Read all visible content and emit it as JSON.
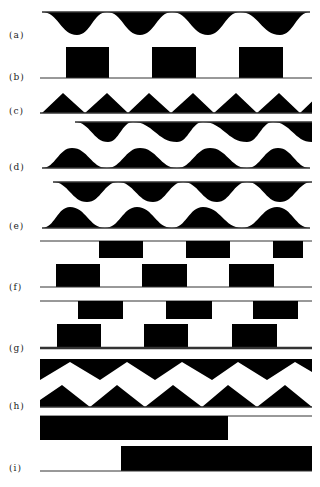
{
  "figure": {
    "fill_color": "#000000",
    "line_color": "#333333",
    "background": "#ffffff",
    "x_start": 40,
    "x_end": 312
  },
  "panels": [
    {
      "id": "a",
      "label": "(a)",
      "label_y": 35,
      "shape": "smooth-wave-hanging",
      "top_line_y": 12,
      "trough_y": 35,
      "x_start": 42,
      "x_end": 310,
      "troughs_x": [
        77,
        140,
        208,
        280
      ],
      "peaks_x": [
        42,
        107,
        172,
        240,
        310
      ]
    },
    {
      "id": "b",
      "label": "(b)",
      "label_y": 77,
      "shape": "rect-pulses",
      "baseline_y": 78,
      "top_y": 47,
      "pulses": [
        [
          66,
          109
        ],
        [
          152,
          196
        ],
        [
          239,
          283
        ]
      ]
    },
    {
      "id": "c",
      "label": "(c)",
      "label_y": 111,
      "shape": "triangle-wave",
      "baseline_y": 113,
      "peak_y": 93,
      "valleys_x": [
        42,
        85,
        128,
        171,
        214,
        257,
        300
      ],
      "peaks_x": [
        63,
        107,
        149,
        193,
        236,
        279
      ],
      "x_end": 312
    },
    {
      "id": "d",
      "label": "(d)",
      "label_y": 167,
      "shape": "double-smooth-wave",
      "upper": {
        "top_line_y": 122,
        "trough_y": 142,
        "x_start": 75,
        "x_end": 312,
        "peaks_x": [
          75,
          133,
          203,
          273
        ],
        "troughs_x": [
          108,
          177,
          247,
          312
        ]
      },
      "lower": {
        "baseline_y": 168,
        "peak_y": 148,
        "x_start": 42,
        "x_end": 310,
        "valleys_x": [
          42,
          107,
          177,
          247,
          310
        ],
        "peaks_x": [
          72,
          140,
          210,
          278
        ]
      }
    },
    {
      "id": "e",
      "label": "(e)",
      "label_y": 226,
      "shape": "double-smooth-wave",
      "upper": {
        "top_line_y": 182,
        "trough_y": 202,
        "x_start": 53,
        "x_end": 312,
        "peaks_x": [
          53,
          118,
          183,
          247,
          312
        ],
        "troughs_x": [
          87,
          153,
          217,
          280
        ]
      },
      "lower": {
        "baseline_y": 228,
        "peak_y": 207,
        "x_start": 42,
        "x_end": 310,
        "valleys_x": [
          42,
          105,
          172,
          242,
          310
        ],
        "peaks_x": [
          70,
          137,
          203,
          277
        ]
      }
    },
    {
      "id": "f",
      "label": "(f)",
      "label_y": 287,
      "shape": "double-rect-pulses",
      "upper": {
        "line_y": 241,
        "bottom_y": 258,
        "pulses": [
          [
            99,
            143
          ],
          [
            186,
            230
          ],
          [
            273,
            303
          ]
        ]
      },
      "lower": {
        "baseline_y": 287,
        "top_y": 264,
        "pulses": [
          [
            56,
            100
          ],
          [
            142,
            187
          ],
          [
            229,
            274
          ]
        ]
      }
    },
    {
      "id": "g",
      "label": "(g)",
      "label_y": 348,
      "shape": "double-rect-pulses",
      "upper": {
        "line_y": 301,
        "bottom_y": 319,
        "pulses": [
          [
            78,
            123
          ],
          [
            166,
            212
          ],
          [
            253,
            298
          ]
        ]
      },
      "lower": {
        "baseline_y": 348,
        "top_y": 324,
        "thick_baseline": true,
        "pulses": [
          [
            57,
            101
          ],
          [
            144,
            188
          ],
          [
            232,
            277
          ]
        ]
      }
    },
    {
      "id": "h",
      "label": "(h)",
      "label_y": 406,
      "shape": "double-zigzag",
      "upper": {
        "top_y": 359,
        "x_start": 40,
        "x_end": 312,
        "points": [
          [
            40,
            380
          ],
          [
            70,
            362
          ],
          [
            100,
            380
          ],
          [
            127,
            362
          ],
          [
            155,
            380
          ],
          [
            182,
            362
          ],
          [
            212,
            380
          ],
          [
            238,
            362
          ],
          [
            267,
            380
          ],
          [
            295,
            362
          ],
          [
            312,
            372
          ]
        ]
      },
      "lower": {
        "baseline_y": 407,
        "x_start": 40,
        "x_end": 312,
        "points": [
          [
            40,
            400
          ],
          [
            62,
            385
          ],
          [
            90,
            407
          ],
          [
            117,
            385
          ],
          [
            145,
            407
          ],
          [
            173,
            385
          ],
          [
            202,
            407
          ],
          [
            228,
            385
          ],
          [
            257,
            407
          ],
          [
            285,
            385
          ],
          [
            312,
            407
          ]
        ]
      }
    },
    {
      "id": "i",
      "label": "(i)",
      "label_y": 468,
      "shape": "double-step",
      "upper": {
        "line_y": 416,
        "bottom_y": 440,
        "rect": [
          40,
          228
        ]
      },
      "lower": {
        "baseline_y": 471,
        "top_y": 446,
        "rect": [
          121,
          312
        ]
      }
    }
  ]
}
